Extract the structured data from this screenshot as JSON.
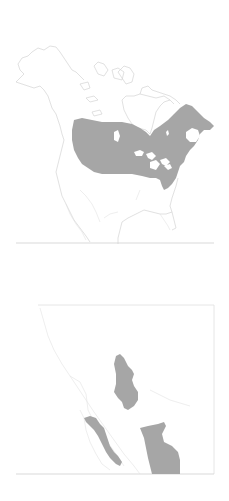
{
  "figure": {
    "panels": [
      {
        "id": "main",
        "region": "North America",
        "description": "Range map with shaded distribution across central/eastern Canada and northeastern United States"
      },
      {
        "id": "inset",
        "region": "Northwestern Mexico",
        "description": "Inset showing disjunct shaded range patches in Baja California and Sierra Madre Occidental"
      }
    ],
    "colors": {
      "range_fill": "#a6a6a6",
      "outline": "#d4d4d4",
      "background": "#ffffff"
    }
  }
}
